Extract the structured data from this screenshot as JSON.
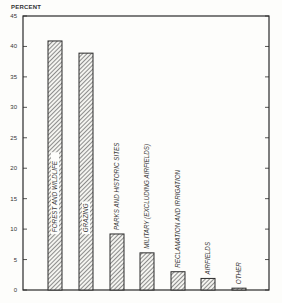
{
  "chart_data": {
    "type": "bar",
    "title": "",
    "xlabel": "",
    "ylabel": "PERCENT",
    "ylim": [
      0,
      45
    ],
    "yticks": [
      0,
      5,
      10,
      15,
      20,
      25,
      30,
      35,
      40,
      45
    ],
    "grid": false,
    "legend": null,
    "categories": [
      "FOREST AND WILDLIFE",
      "GRAZING",
      "PARKS AND HISTORIC SITES",
      "MILITARY (EXCLUDING AIRFIELDS)",
      "RECLAMATION AND IRRIGATION",
      "AIRFIELDS",
      "OTHER"
    ],
    "values": [
      40.9,
      38.9,
      9.2,
      6.1,
      3.0,
      1.9,
      0.3
    ],
    "bar_fill": "diagonal-hatch",
    "label_placement": "vertical text inside or above each bar"
  },
  "colors": {
    "background": "#fdfdfb",
    "ink": "#2a2a2a",
    "hatch": "#555555"
  }
}
